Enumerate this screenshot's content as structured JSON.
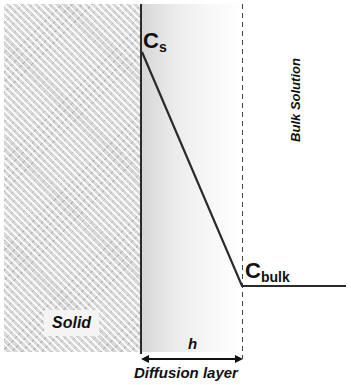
{
  "diagram": {
    "title": "",
    "regions": {
      "solid": "Solid",
      "diffusion_layer": "Diffusion layer",
      "bulk_solution": "Bulk Solution"
    },
    "labels": {
      "cs_main": "C",
      "cs_sub": "s",
      "cbulk_main": "C",
      "cbulk_sub": "bulk",
      "thickness": "h"
    },
    "concentration_profile": [
      {
        "point": "Cs",
        "x": 142,
        "y": 52
      },
      {
        "point": "Cbulk",
        "x": 242,
        "y": 286
      },
      {
        "point": "end",
        "x": 346,
        "y": 286
      }
    ],
    "colors": {
      "line": "#2a2a2a",
      "solid_fill": "#d8d8d8",
      "background": "#ffffff"
    }
  }
}
